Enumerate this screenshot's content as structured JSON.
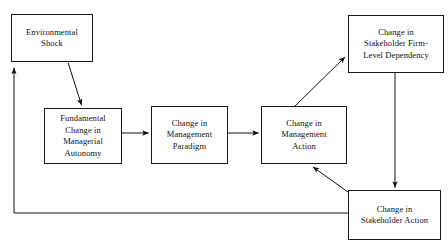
{
  "diagram": {
    "type": "flow-diagram",
    "background_color": "#ffffff",
    "line_color": "#1a1a1a",
    "text_color": "#111111",
    "nodes": [
      {
        "id": "environmental-shock",
        "label": "Environmental\nShock",
        "x": 11,
        "y": 14,
        "w": 82,
        "h": 48
      },
      {
        "id": "fundamental-change-managerial-autonomy",
        "label": "Fundamental\nChange in\nManagerial\nAutonomy",
        "x": 44,
        "y": 108,
        "w": 78,
        "h": 56
      },
      {
        "id": "change-management-paradigm",
        "label": "Change in\nManagement\nParadigm",
        "x": 151,
        "y": 106,
        "w": 77,
        "h": 58
      },
      {
        "id": "change-management-action",
        "label": "Change in\nManagement\nAction",
        "x": 261,
        "y": 106,
        "w": 86,
        "h": 58
      },
      {
        "id": "change-stakeholder-firm-level-dependency",
        "label": "Change in\nStakeholder Firm-\nLevel Dependency",
        "x": 348,
        "y": 15,
        "w": 96,
        "h": 58
      },
      {
        "id": "change-stakeholder-action",
        "label": "Change in\nStakeholder Action",
        "x": 348,
        "y": 190,
        "w": 93,
        "h": 50
      }
    ],
    "edges": [
      {
        "id": "shock-to-autonomy",
        "from": "environmental-shock",
        "to": "fundamental-change-managerial-autonomy",
        "kind": "arrow-diagonal"
      },
      {
        "id": "autonomy-to-paradigm",
        "from": "fundamental-change-managerial-autonomy",
        "to": "change-management-paradigm",
        "kind": "arrow-horizontal"
      },
      {
        "id": "paradigm-to-action",
        "from": "change-management-paradigm",
        "to": "change-management-action",
        "kind": "arrow-horizontal"
      },
      {
        "id": "action-to-dependency",
        "from": "change-management-action",
        "to": "change-stakeholder-firm-level-dependency",
        "kind": "arrow-diagonal"
      },
      {
        "id": "dependency-to-stakeholder-action",
        "from": "change-stakeholder-firm-level-dependency",
        "to": "change-stakeholder-action",
        "kind": "arrow-vertical"
      },
      {
        "id": "stakeholder-action-to-management-action",
        "from": "change-stakeholder-action",
        "to": "change-management-action",
        "kind": "arrow-diagonal"
      },
      {
        "id": "stakeholder-action-to-shock-feedback",
        "from": "change-stakeholder-action",
        "to": "environmental-shock",
        "kind": "arrow-elbow-feedback"
      }
    ]
  }
}
